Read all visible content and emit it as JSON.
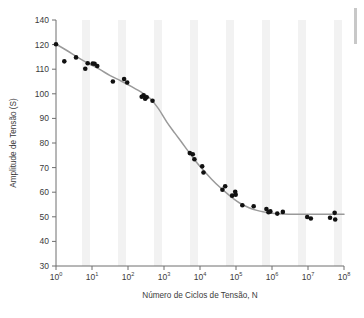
{
  "chart_data": {
    "type": "scatter",
    "title": "",
    "xlabel": "Número de Ciclos de Tensão, N",
    "ylabel": "Amplitude de Tensão (S)",
    "xscale": "log",
    "yscale": "linear",
    "xlim": [
      1,
      100000000
    ],
    "ylim": [
      30,
      140
    ],
    "grid": false,
    "legend": null,
    "x_tick_labels": [
      "10⁰",
      "10¹",
      "10²",
      "10³",
      "10⁴",
      "10⁵",
      "10⁶",
      "10⁷",
      "10⁸"
    ],
    "x_tick_bases": [
      "10",
      "10",
      "10",
      "10",
      "10",
      "10",
      "10",
      "10",
      "10"
    ],
    "x_tick_exponents": [
      "0",
      "1",
      "2",
      "3",
      "4",
      "5",
      "6",
      "7",
      "8"
    ],
    "x_tick_values": [
      1,
      10,
      100,
      1000,
      10000,
      100000,
      1000000,
      10000000,
      100000000
    ],
    "y_tick_labels": [
      "140",
      "120",
      "110",
      "100",
      "90",
      "80",
      "70",
      "60",
      "50",
      "40",
      "30"
    ],
    "y_tick_values": [
      140,
      120,
      110,
      100,
      90,
      80,
      70,
      60,
      50,
      40,
      30
    ],
    "series": [
      {
        "name": "Dados de fadiga",
        "type": "scatter",
        "marker": "circle",
        "color": "#111111",
        "points": [
          [
            1.0,
            120.3
          ],
          [
            1.7,
            113.2
          ],
          [
            3.6,
            114.8
          ],
          [
            6.5,
            110.2
          ],
          [
            7.6,
            112.4
          ],
          [
            10.5,
            112.3
          ],
          [
            11.8,
            112.2
          ],
          [
            14.0,
            111.3
          ],
          [
            38.0,
            105.0
          ],
          [
            78.0,
            106.0
          ],
          [
            95.0,
            104.6
          ],
          [
            240.0,
            98.8
          ],
          [
            270.0,
            99.4
          ],
          [
            300.0,
            98.0
          ],
          [
            330.0,
            98.6
          ],
          [
            480.0,
            97.2
          ],
          [
            5200.0,
            75.9
          ],
          [
            6300.0,
            75.4
          ],
          [
            7000.0,
            73.4
          ],
          [
            11500.0,
            70.5
          ],
          [
            12500.0,
            68.0
          ],
          [
            42000.0,
            61.0
          ],
          [
            50000.0,
            62.4
          ],
          [
            78000.0,
            58.6
          ],
          [
            95000.0,
            60.2
          ],
          [
            98000.0,
            59.0
          ],
          [
            150000.0,
            54.7
          ],
          [
            310000.0,
            54.3
          ],
          [
            700000.0,
            53.2
          ],
          [
            800000.0,
            51.9
          ],
          [
            900000.0,
            52.2
          ],
          [
            1400000.0,
            51.3
          ],
          [
            2000000.0,
            52.0
          ],
          [
            9500000.0,
            49.9
          ],
          [
            12000000.0,
            49.3
          ],
          [
            41000000.0,
            49.6
          ],
          [
            55000000.0,
            51.6
          ],
          [
            57000000.0,
            48.9
          ]
        ]
      },
      {
        "name": "Curva ajustada",
        "type": "line",
        "color": "#9a9a9a",
        "points": [
          [
            1.0,
            120.4
          ],
          [
            2.0,
            117.6
          ],
          [
            4.0,
            114.8
          ],
          [
            8.0,
            112.3
          ],
          [
            16.0,
            110.0
          ],
          [
            32.0,
            107.4
          ],
          [
            64.0,
            105.2
          ],
          [
            130.0,
            102.8
          ],
          [
            260.0,
            100.2
          ],
          [
            420.0,
            98.0
          ],
          [
            700.0,
            94.0
          ],
          [
            1200.0,
            88.5
          ],
          [
            2000.0,
            84.0
          ],
          [
            3200.0,
            80.0
          ],
          [
            5200.0,
            75.8
          ],
          [
            8000.0,
            72.2
          ],
          [
            13000.0,
            68.6
          ],
          [
            21000.0,
            65.3
          ],
          [
            34000.0,
            62.3
          ],
          [
            55000.0,
            59.6
          ],
          [
            88000.0,
            57.2
          ],
          [
            140000.0,
            55.2
          ],
          [
            230000.0,
            53.7
          ],
          [
            380000.0,
            52.6
          ],
          [
            620000.0,
            51.9
          ],
          [
            1000000.0,
            51.4
          ],
          [
            2000000.0,
            51.1
          ],
          [
            5000000.0,
            51.0
          ],
          [
            20000000.0,
            51.0
          ],
          [
            100000000.0,
            51.0
          ]
        ]
      }
    ]
  },
  "figure": {
    "background_color": "#ffffff",
    "band_color": "#f2f2f2",
    "axis_color": "#6e6e6e",
    "curve_color": "#9a9a9a",
    "marker_color": "#111111",
    "artifact_color": "#c8c8c8"
  }
}
